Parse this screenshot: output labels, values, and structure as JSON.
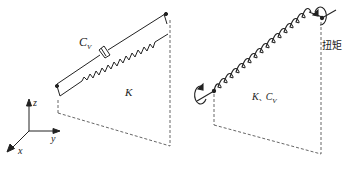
{
  "left_diagram": {
    "damper_label": "C",
    "damper_subscript": "V",
    "spring_label": "K",
    "axes": {
      "x": "x",
      "y": "y",
      "z": "z"
    }
  },
  "right_diagram": {
    "spring_label": "K",
    "separator": "、",
    "damper_label": "C",
    "damper_subscript": "V",
    "torque_label": "扭矩"
  },
  "colors": {
    "line": "#222222",
    "dash": "#555555",
    "background": "#ffffff"
  }
}
